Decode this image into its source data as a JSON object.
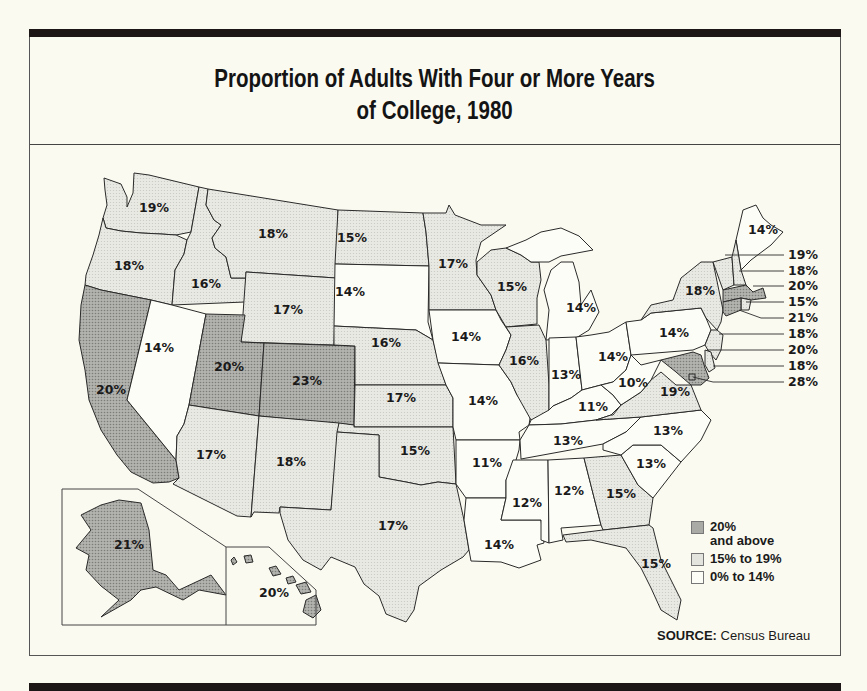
{
  "title": {
    "line1": "Proportion of Adults With Four or More Years",
    "line2": "of College, 1980"
  },
  "colors": {
    "high": "#a9a9a5",
    "mid": "#e4e4de",
    "low": "#fdfdf7",
    "line": "#2a2a2a",
    "background": "#fbfaf1",
    "bar": "#1c1616"
  },
  "legend": {
    "items": [
      {
        "key": "high",
        "label_line1": "20%",
        "label_line2": "and above"
      },
      {
        "key": "mid",
        "label_line1": "15% to 19%",
        "label_line2": ""
      },
      {
        "key": "low",
        "label_line1": "0% to 14%",
        "label_line2": ""
      }
    ]
  },
  "source": {
    "label": "SOURCE:",
    "text": " Census Bureau"
  },
  "states": [
    {
      "name": "Washington",
      "value": "19%",
      "cat": "mid"
    },
    {
      "name": "Oregon",
      "value": "18%",
      "cat": "mid"
    },
    {
      "name": "California",
      "value": "20%",
      "cat": "high"
    },
    {
      "name": "Idaho",
      "value": "16%",
      "cat": "mid"
    },
    {
      "name": "Nevada",
      "value": "14%",
      "cat": "low"
    },
    {
      "name": "Montana",
      "value": "18%",
      "cat": "mid"
    },
    {
      "name": "Wyoming",
      "value": "17%",
      "cat": "mid"
    },
    {
      "name": "Utah",
      "value": "20%",
      "cat": "high"
    },
    {
      "name": "Colorado",
      "value": "23%",
      "cat": "high"
    },
    {
      "name": "Arizona",
      "value": "17%",
      "cat": "mid"
    },
    {
      "name": "New Mexico",
      "value": "18%",
      "cat": "mid"
    },
    {
      "name": "North Dakota",
      "value": "15%",
      "cat": "mid"
    },
    {
      "name": "South Dakota",
      "value": "14%",
      "cat": "low"
    },
    {
      "name": "Nebraska",
      "value": "16%",
      "cat": "mid"
    },
    {
      "name": "Kansas",
      "value": "17%",
      "cat": "mid"
    },
    {
      "name": "Oklahoma",
      "value": "15%",
      "cat": "mid"
    },
    {
      "name": "Texas",
      "value": "17%",
      "cat": "mid"
    },
    {
      "name": "Minnesota",
      "value": "17%",
      "cat": "mid"
    },
    {
      "name": "Iowa",
      "value": "14%",
      "cat": "low"
    },
    {
      "name": "Missouri",
      "value": "14%",
      "cat": "low"
    },
    {
      "name": "Arkansas",
      "value": "11%",
      "cat": "low"
    },
    {
      "name": "Louisiana",
      "value": "14%",
      "cat": "low"
    },
    {
      "name": "Wisconsin",
      "value": "15%",
      "cat": "mid"
    },
    {
      "name": "Illinois",
      "value": "16%",
      "cat": "mid"
    },
    {
      "name": "Michigan",
      "value": "14%",
      "cat": "low"
    },
    {
      "name": "Indiana",
      "value": "13%",
      "cat": "low"
    },
    {
      "name": "Ohio",
      "value": "14%",
      "cat": "low"
    },
    {
      "name": "Kentucky",
      "value": "11%",
      "cat": "low"
    },
    {
      "name": "Tennessee",
      "value": "13%",
      "cat": "low"
    },
    {
      "name": "Mississippi",
      "value": "12%",
      "cat": "low"
    },
    {
      "name": "Alabama",
      "value": "12%",
      "cat": "low"
    },
    {
      "name": "Georgia",
      "value": "15%",
      "cat": "mid"
    },
    {
      "name": "Florida",
      "value": "15%",
      "cat": "mid"
    },
    {
      "name": "South Carolina",
      "value": "13%",
      "cat": "low"
    },
    {
      "name": "North Carolina",
      "value": "13%",
      "cat": "low"
    },
    {
      "name": "Virginia",
      "value": "19%",
      "cat": "mid"
    },
    {
      "name": "West Virginia",
      "value": "10%",
      "cat": "low"
    },
    {
      "name": "Pennsylvania",
      "value": "14%",
      "cat": "low"
    },
    {
      "name": "New York",
      "value": "18%",
      "cat": "mid"
    },
    {
      "name": "Maine",
      "value": "14%",
      "cat": "low"
    },
    {
      "name": "Vermont",
      "value": "19%",
      "cat": "mid"
    },
    {
      "name": "New Hampshire",
      "value": "18%",
      "cat": "mid"
    },
    {
      "name": "Massachusetts",
      "value": "20%",
      "cat": "high"
    },
    {
      "name": "Rhode Island",
      "value": "15%",
      "cat": "mid"
    },
    {
      "name": "Connecticut",
      "value": "21%",
      "cat": "high"
    },
    {
      "name": "New Jersey",
      "value": "18%",
      "cat": "mid"
    },
    {
      "name": "Maryland",
      "value": "20%",
      "cat": "high"
    },
    {
      "name": "Delaware",
      "value": "18%",
      "cat": "mid"
    },
    {
      "name": "District of Columbia",
      "value": "28%",
      "cat": "high"
    },
    {
      "name": "Alaska",
      "value": "21%",
      "cat": "high"
    },
    {
      "name": "Hawaii",
      "value": "20%",
      "cat": "high"
    }
  ],
  "chart_data": {
    "type": "choropleth",
    "title": "Proportion of Adults With Four or More Years of College, 1980",
    "source": "Census Bureau",
    "legend": [
      "20% and above",
      "15% to 19%",
      "0% to 14%"
    ],
    "values": {
      "WA": 19,
      "OR": 18,
      "CA": 20,
      "ID": 16,
      "NV": 14,
      "MT": 18,
      "WY": 17,
      "UT": 20,
      "CO": 23,
      "AZ": 17,
      "NM": 18,
      "ND": 15,
      "SD": 14,
      "NE": 16,
      "KS": 17,
      "OK": 15,
      "TX": 17,
      "MN": 17,
      "IA": 14,
      "MO": 14,
      "AR": 11,
      "LA": 14,
      "WI": 15,
      "IL": 16,
      "MI": 14,
      "IN": 13,
      "OH": 14,
      "KY": 11,
      "TN": 13,
      "MS": 12,
      "AL": 12,
      "GA": 15,
      "FL": 15,
      "SC": 13,
      "NC": 13,
      "VA": 19,
      "WV": 10,
      "PA": 14,
      "NY": 18,
      "ME": 14,
      "VT": 19,
      "NH": 18,
      "MA": 20,
      "RI": 15,
      "CT": 21,
      "NJ": 18,
      "MD": 20,
      "DE": 18,
      "DC": 28,
      "AK": 21,
      "HI": 20
    }
  }
}
